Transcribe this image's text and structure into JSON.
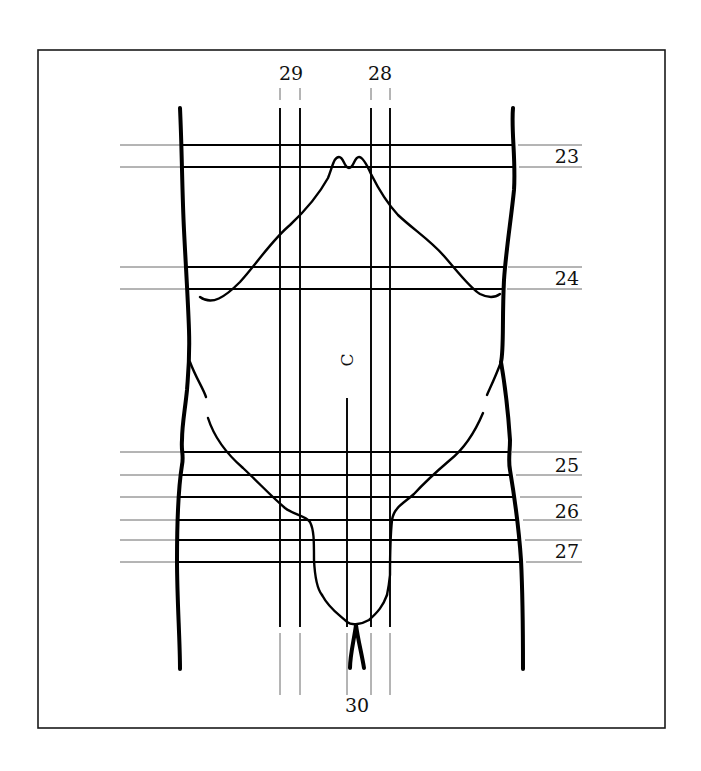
{
  "figure": {
    "frame": {
      "x": 38,
      "y": 50,
      "width": 627,
      "height": 678
    },
    "horizontal_lines": [
      {
        "id": "23a",
        "y": 145,
        "thick_x1": 180,
        "thick_x2": 514,
        "left_thin_x1": 120,
        "right_thin_x2": 582
      },
      {
        "id": "23b",
        "y": 167,
        "thick_x1": 181,
        "thick_x2": 515,
        "left_thin_x1": 120,
        "right_thin_x2": 582
      },
      {
        "id": "24a",
        "y": 267,
        "thick_x1": 184,
        "thick_x2": 504,
        "left_thin_x1": 120,
        "right_thin_x2": 582
      },
      {
        "id": "24b",
        "y": 289,
        "thick_x1": 186,
        "thick_x2": 503,
        "left_thin_x1": 120,
        "right_thin_x2": 582
      },
      {
        "id": "25a",
        "y": 452,
        "thick_x1": 182,
        "thick_x2": 508,
        "left_thin_x1": 120,
        "right_thin_x2": 582
      },
      {
        "id": "25b",
        "y": 475,
        "thick_x1": 180,
        "thick_x2": 512,
        "left_thin_x1": 120,
        "right_thin_x2": 582
      },
      {
        "id": "26a",
        "y": 497,
        "thick_x1": 178,
        "thick_x2": 516,
        "left_thin_x1": 120,
        "right_thin_x2": 582
      },
      {
        "id": "26b",
        "y": 520,
        "thick_x1": 177,
        "thick_x2": 519,
        "left_thin_x1": 120,
        "right_thin_x2": 582
      },
      {
        "id": "27a",
        "y": 540,
        "thick_x1": 177,
        "thick_x2": 521,
        "left_thin_x1": 120,
        "right_thin_x2": 582
      },
      {
        "id": "27b",
        "y": 562,
        "thick_x1": 177,
        "thick_x2": 522,
        "left_thin_x1": 120,
        "right_thin_x2": 582
      }
    ],
    "vertical_lines": [
      {
        "id": "29a",
        "x": 280,
        "thin_top_y1": 88,
        "thin_top_y2": 100,
        "thick_y1": 108,
        "thick_y2": 627,
        "thin_bottom_y1": 633,
        "thin_bottom_y2": 695
      },
      {
        "id": "29b",
        "x": 300,
        "thin_top_y1": 88,
        "thin_top_y2": 100,
        "thick_y1": 108,
        "thick_y2": 627,
        "thin_bottom_y1": 633,
        "thin_bottom_y2": 695
      },
      {
        "id": "28a",
        "x": 371,
        "thin_top_y1": 88,
        "thin_top_y2": 100,
        "thick_y1": 108,
        "thick_y2": 627,
        "thin_bottom_y1": 633,
        "thin_bottom_y2": 695
      },
      {
        "id": "28b",
        "x": 390,
        "thin_top_y1": 88,
        "thin_top_y2": 100,
        "thick_y1": 108,
        "thick_y2": 627,
        "thin_bottom_y1": 633,
        "thin_bottom_y2": 695
      },
      {
        "id": "30a",
        "x": 347,
        "thin_top_y1": null,
        "thin_top_y2": null,
        "thick_y1": 398,
        "thick_y2": 627,
        "thin_bottom_y1": 633,
        "thin_bottom_y2": 695
      }
    ],
    "labels": [
      {
        "text": "29",
        "x": 291,
        "y": 80,
        "anchor": "middle"
      },
      {
        "text": "28",
        "x": 380,
        "y": 80,
        "anchor": "middle"
      },
      {
        "text": "23",
        "x": 579,
        "y": 163,
        "anchor": "end"
      },
      {
        "text": "24",
        "x": 579,
        "y": 285,
        "anchor": "end"
      },
      {
        "text": "25",
        "x": 579,
        "y": 472,
        "anchor": "end"
      },
      {
        "text": "26",
        "x": 579,
        "y": 518,
        "anchor": "end"
      },
      {
        "text": "27",
        "x": 579,
        "y": 558,
        "anchor": "end"
      },
      {
        "text": "30",
        "x": 357,
        "y": 712,
        "anchor": "middle"
      }
    ],
    "navel": {
      "text": "C",
      "x": 347,
      "y": 360,
      "rotation": -90
    },
    "paths": {
      "left_outline": "M180,108 C182,150 182,190 184,230 C186,270 188,300 189,330 C190,360 188,375 187,390 C185,410 182,425 182,440 C181,452 184,455 182,465 C178,490 177,520 177,560 C177,600 180,640 180,669",
      "right_outline": "M513,108 C511,130 516,160 514,190 C511,220 506,250 504,280 C502,320 504,350 501,362 C505,385 508,410 510,440 C510,452 508,460 510,470 C515,500 519,530 521,560 C523,600 523,640 523,669",
      "rib_cage": "M200,297 C212,306 225,297 240,282 C258,262 272,240 290,225 C306,210 318,196 328,178 C333,165 334,157 339,157 C344,157 344,168 349,168 C354,168 354,157 359,157 C363,157 367,165 371,174 C378,188 386,202 398,215 C414,230 430,240 444,256 C458,272 470,288 480,294 C490,299 496,297 500,294",
      "left_flank_upper": "M190,362 C196,378 203,388 206,397",
      "left_flank_lower": "M208,418 C215,440 228,455 243,468 C260,484 272,497 285,508 C294,515 305,515 310,522 C314,530 314,540 314,560 C315,580 318,590 322,595",
      "pubic_curve": "M322,595 C330,610 340,615 347,622 C352,626 362,624 369,620 C378,612 383,606 387,595",
      "right_flank_upper": "M501,362 C495,378 490,388 487,395",
      "right_flank_lower": "M483,413 C475,432 465,448 450,460 C436,472 424,483 414,494 C404,503 394,507 392,520 C390,540 390,560 390,575 C389,585 388,590 387,595",
      "genital_left": "M356,625 C354,640 350,655 350,668",
      "genital_right": "M356,625 C358,640 362,655 364,668"
    }
  }
}
